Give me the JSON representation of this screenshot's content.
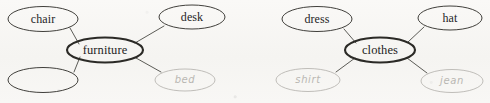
{
  "document": {
    "type": "word-web-worksheet",
    "background_color": "#f7f6f4",
    "ink_color": "#2b2a26",
    "pencil_color": "#b9b7b2"
  },
  "clusters": [
    {
      "id": "furniture-web",
      "hub": {
        "label": "furniture",
        "style": "printed",
        "cx": 105,
        "cy": 50,
        "rx": 38,
        "ry": 12.5,
        "stroke_width": 2.1
      },
      "nodes": [
        {
          "id": "chair",
          "label": "chair",
          "style": "printed",
          "cx": 43,
          "cy": 19,
          "rx": 35,
          "ry": 12.5,
          "stroke_width": 0.9
        },
        {
          "id": "desk",
          "label": "desk",
          "style": "printed",
          "cx": 192,
          "cy": 17,
          "rx": 33,
          "ry": 12,
          "stroke_width": 0.9
        },
        {
          "id": "blank",
          "label": "",
          "style": "empty",
          "cx": 43,
          "cy": 80,
          "rx": 35,
          "ry": 12.5,
          "stroke_width": 0.9
        },
        {
          "id": "bed",
          "label": "bed",
          "style": "handwritten",
          "cx": 185,
          "cy": 80,
          "rx": 30,
          "ry": 11,
          "stroke_width": 0.9
        }
      ]
    },
    {
      "id": "clothes-web",
      "hub": {
        "label": "clothes",
        "style": "printed",
        "cx": 380,
        "cy": 50,
        "rx": 35,
        "ry": 12.5,
        "stroke_width": 2.1
      },
      "nodes": [
        {
          "id": "dress",
          "label": "dress",
          "style": "printed",
          "cx": 317,
          "cy": 19,
          "rx": 35,
          "ry": 12.5,
          "stroke_width": 0.9
        },
        {
          "id": "hat",
          "label": "hat",
          "style": "printed",
          "cx": 450,
          "cy": 18,
          "rx": 32,
          "ry": 12,
          "stroke_width": 0.9
        },
        {
          "id": "shirt",
          "label": "shirt",
          "style": "handwritten",
          "cx": 308,
          "cy": 80,
          "rx": 32,
          "ry": 11.5,
          "stroke_width": 0.9
        },
        {
          "id": "jean",
          "label": "jean",
          "style": "handwritten",
          "cx": 452,
          "cy": 81,
          "rx": 31,
          "ry": 11.5,
          "stroke_width": 0.9
        }
      ]
    }
  ],
  "connectors": [
    {
      "id": "furniture-chair",
      "x1": 70,
      "y1": 28,
      "x2": 79,
      "y2": 44
    },
    {
      "id": "furniture-desk",
      "x1": 164,
      "y1": 26,
      "x2": 135,
      "y2": 43
    },
    {
      "id": "furniture-blank",
      "x1": 74,
      "y1": 72,
      "x2": 80,
      "y2": 57
    },
    {
      "id": "furniture-bed",
      "x1": 161,
      "y1": 72,
      "x2": 136,
      "y2": 58
    },
    {
      "id": "clothes-dress",
      "x1": 344,
      "y1": 29,
      "x2": 356,
      "y2": 43
    },
    {
      "id": "clothes-hat",
      "x1": 424,
      "y1": 27,
      "x2": 408,
      "y2": 42
    },
    {
      "id": "clothes-shirt",
      "x1": 336,
      "y1": 72,
      "x2": 355,
      "y2": 58
    },
    {
      "id": "clothes-jean",
      "x1": 427,
      "y1": 73,
      "x2": 407,
      "y2": 58
    }
  ]
}
